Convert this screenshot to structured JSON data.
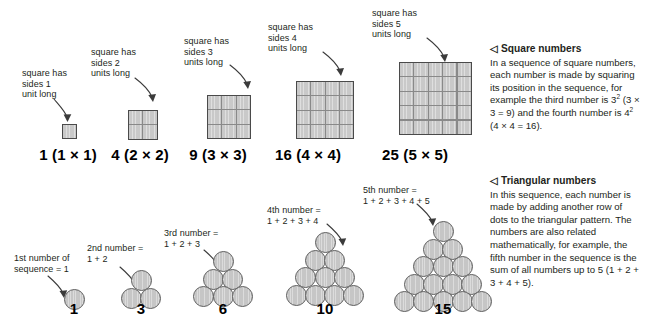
{
  "squares": {
    "callouts": [
      "square has\nsides 1\nunit long",
      "square has\nsides 2\nunits long",
      "square has\nsides 3\nunits long",
      "square has\nsides 4\nunits long",
      "square has\nsides 5\nunits long"
    ],
    "captions": [
      "1 (1 × 1)",
      "4 (2 × 2)",
      "9 (3 × 3)",
      "16 (4 × 4)",
      "25 (5 × 5)"
    ],
    "sides": [
      1,
      2,
      3,
      4,
      5
    ],
    "values": [
      1,
      4,
      9,
      16,
      25
    ]
  },
  "triangles": {
    "callouts": [
      "1st number of\nsequence = 1",
      "2nd number =\n1 + 2",
      "3rd number =\n1 + 2 + 3",
      "4th number =\n1 + 2 + 3 + 4",
      "5th number =\n1 + 2 + 3 + 4 + 5"
    ],
    "captions": [
      "1",
      "3",
      "6",
      "10",
      "15"
    ],
    "rows": [
      1,
      2,
      3,
      4,
      5
    ],
    "values": [
      1,
      3,
      6,
      10,
      15
    ]
  },
  "panel_square": {
    "marker": "◁",
    "heading": "Square numbers",
    "body_pre": "In a sequence of square numbers, each number is made by squaring its position in the sequence, for example the third number is 3",
    "body_sup1": "2",
    "body_mid": " (3 × 3 = 9) and the fourth number is 4",
    "body_sup2": "2",
    "body_post": " (4 × 4 = 16)."
  },
  "panel_triangular": {
    "marker": "◁",
    "heading": "Triangular numbers",
    "body": "In this sequence, each number is made by adding another row of dots to the triangular pattern. The numbers are also related mathematically, for example, the fifth number in the sequence is the sum of all numbers up to 5 (1 + 2 + 3 + 4 + 5)."
  },
  "colors": {
    "cell_fill": "#c9c9c9",
    "cell_border": "#4a4a4a",
    "circle_fill": "#c6c6c6",
    "circle_border": "#5f5f5f",
    "arrow": "#3b3b3b",
    "text": "#231f20",
    "background": "#ffffff"
  }
}
